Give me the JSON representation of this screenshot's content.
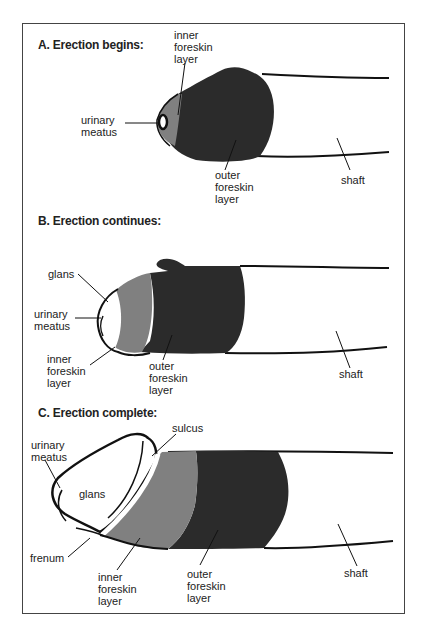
{
  "figure": {
    "panels": [
      {
        "id": "A",
        "title": "A. Erection begins:",
        "labels": {
          "inner_foreskin": "inner\nforeskin\nlayer",
          "urinary_meatus": "urinary\nmeatus",
          "outer_foreskin": "outer\nforeskin\nlayer",
          "shaft": "shaft"
        }
      },
      {
        "id": "B",
        "title": "B. Erection continues:",
        "labels": {
          "glans": "glans",
          "urinary_meatus": "urinary\nmeatus",
          "inner_foreskin": "inner\nforeskin\nlayer",
          "outer_foreskin": "outer\nforeskin\nlayer",
          "shaft": "shaft"
        }
      },
      {
        "id": "C",
        "title": "C. Erection complete:",
        "labels": {
          "sulcus": "sulcus",
          "urinary_meatus": "urinary\nmeatus",
          "glans": "glans",
          "frenum": "frenum",
          "inner_foreskin": "inner\nforeskin\nlayer",
          "outer_foreskin": "outer\nforeskin\nlayer",
          "shaft": "shaft"
        }
      }
    ],
    "colors": {
      "outer_foreskin": "#2b2b2b",
      "inner_foreskin": "#808080",
      "outline": "#111111",
      "glans": "#ffffff"
    }
  }
}
